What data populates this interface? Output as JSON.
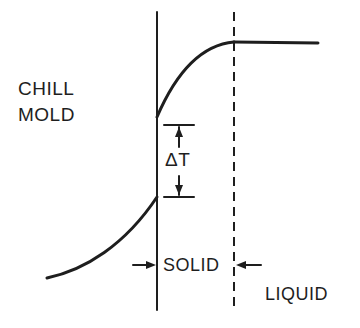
{
  "diagram": {
    "labels": {
      "chill": "CHILL",
      "mold": "MOLD",
      "delta_t": "ΔT",
      "solid": "SOLID",
      "liquid": "LIQUID"
    },
    "elements": {
      "solid_boundary": "solid vertical line at mold/solid interface",
      "liquidus_boundary": "dashed vertical line at solid/liquid interface",
      "temperature_curve": "temperature profile: rises across chill mold, jumps by ΔT at interface, rises through solid, flat in liquid",
      "delta_t_indicator": "dimension arrows marking temperature gap ΔT at mold/solid interface",
      "solid_width_indicator": "inward-pointing arrows marking solid region width"
    },
    "colors": {
      "ink": "#1e1e1e",
      "background": "#ffffff"
    }
  }
}
